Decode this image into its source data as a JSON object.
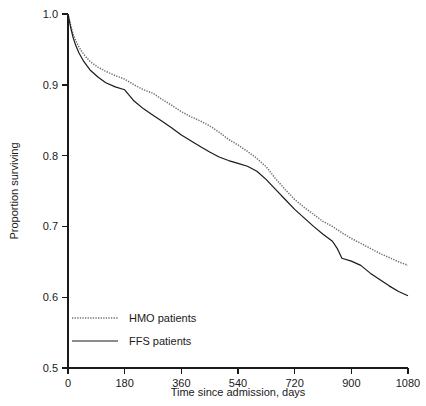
{
  "chart_data": {
    "type": "line",
    "title": "",
    "subtitle": "",
    "xlabel": "Time since admission, days",
    "ylabel": "Proportion surviving",
    "xlim": [
      0,
      1080
    ],
    "ylim": [
      0.5,
      1.0
    ],
    "xticks": [
      0,
      180,
      360,
      540,
      720,
      900,
      1080
    ],
    "xtick_labels": [
      "0",
      "180",
      "360",
      "540",
      "720",
      "900",
      "1080"
    ],
    "yticks": [
      0.5,
      0.6,
      0.7,
      0.8,
      0.9,
      1.0
    ],
    "ytick_labels": [
      "0.5",
      "0.6",
      "0.7",
      "0.8",
      "0.9",
      "1.0"
    ],
    "grid": false,
    "legend_position": "lower-left-inside",
    "series": [
      {
        "name": "HMO patients",
        "style": "dotted",
        "color": "#6e6e6e",
        "x": [
          0,
          8,
          16,
          25,
          35,
          50,
          70,
          95,
          120,
          150,
          180,
          210,
          240,
          270,
          300,
          330,
          360,
          390,
          420,
          450,
          480,
          510,
          540,
          570,
          600,
          630,
          660,
          690,
          720,
          750,
          780,
          810,
          840,
          870,
          900,
          930,
          960,
          990,
          1020,
          1050,
          1080
        ],
        "y": [
          1.0,
          0.985,
          0.972,
          0.962,
          0.953,
          0.943,
          0.933,
          0.925,
          0.919,
          0.913,
          0.908,
          0.9,
          0.893,
          0.888,
          0.879,
          0.871,
          0.862,
          0.855,
          0.849,
          0.842,
          0.833,
          0.823,
          0.815,
          0.806,
          0.796,
          0.784,
          0.767,
          0.752,
          0.738,
          0.727,
          0.717,
          0.707,
          0.7,
          0.691,
          0.683,
          0.676,
          0.669,
          0.662,
          0.656,
          0.65,
          0.645
        ]
      },
      {
        "name": "FFS patients",
        "style": "solid",
        "color": "#1a1a1a",
        "x": [
          0,
          8,
          16,
          25,
          35,
          50,
          70,
          95,
          120,
          150,
          180,
          210,
          240,
          270,
          300,
          330,
          360,
          390,
          420,
          450,
          480,
          510,
          540,
          570,
          600,
          630,
          660,
          690,
          720,
          750,
          780,
          810,
          840,
          855,
          870,
          900,
          930,
          960,
          990,
          1020,
          1050,
          1080
        ],
        "y": [
          1.0,
          0.982,
          0.967,
          0.955,
          0.945,
          0.933,
          0.921,
          0.911,
          0.903,
          0.897,
          0.893,
          0.877,
          0.866,
          0.857,
          0.848,
          0.839,
          0.829,
          0.821,
          0.813,
          0.805,
          0.798,
          0.793,
          0.789,
          0.785,
          0.778,
          0.766,
          0.752,
          0.738,
          0.724,
          0.712,
          0.7,
          0.689,
          0.679,
          0.669,
          0.655,
          0.651,
          0.645,
          0.634,
          0.625,
          0.616,
          0.608,
          0.602
        ]
      }
    ],
    "legend": [
      {
        "label": "HMO patients",
        "style": "dotted",
        "color": "#6e6e6e"
      },
      {
        "label": "FFS patients",
        "style": "solid",
        "color": "#1a1a1a"
      }
    ]
  }
}
